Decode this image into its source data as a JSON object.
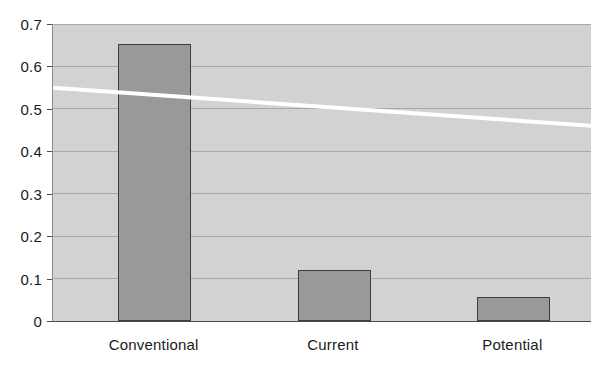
{
  "chart_data": {
    "type": "bar",
    "title": "",
    "subtitle": "",
    "xlabel": "",
    "ylabel": "",
    "categories": [
      "Conventional",
      "Current",
      "Potential"
    ],
    "values": [
      0.653,
      0.12,
      0.057
    ],
    "series": [
      {
        "name": "bars",
        "type": "bar",
        "values": [
          0.653,
          0.12,
          0.057
        ]
      },
      {
        "name": "trend-line",
        "type": "line",
        "color": "#ffffff",
        "x": [
          0,
          1
        ],
        "values": [
          0.55,
          0.46
        ]
      }
    ],
    "ylim": [
      0,
      0.7
    ],
    "yticks": [
      0,
      0.1,
      0.2,
      0.3,
      0.4,
      0.5,
      0.6,
      0.7
    ],
    "ytick_labels": [
      "0",
      "0.1",
      "0.2",
      "0.3",
      "0.4",
      "0.5",
      "0.6",
      "0.7"
    ],
    "xtick_labels": [
      "Conventional",
      "Current",
      "Potential"
    ],
    "grid": true,
    "grid_axis": "y",
    "legend": false,
    "legend_position": "none",
    "annotations": [],
    "colors": {
      "plot_background": "#d2d2d2",
      "figure_background": "#ffffff",
      "bar_fill": "#999999",
      "bar_border": "#3d3d3d",
      "gridline": "#a8a8a8",
      "axis_line": "#4a4a4a",
      "trend_line": "#ffffff",
      "tick_text": "#1a1a1a"
    }
  }
}
